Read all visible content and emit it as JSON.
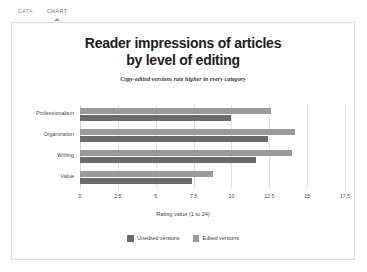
{
  "tabs": [
    {
      "label": "DATA",
      "active": false
    },
    {
      "label": "CHART",
      "active": true
    }
  ],
  "chart_data": {
    "type": "bar",
    "orientation": "horizontal",
    "title": "Reader impressions of articles by level of editing",
    "title_line1": "Reader impressions of articles",
    "title_line2": "by level of editing",
    "subtitle": "Copy-edited versions rate higher in every category",
    "categories": [
      "Professionalism",
      "Organization",
      "Writing",
      "Value"
    ],
    "series": [
      {
        "name": "Unedited versions",
        "color": "#6b6b6b",
        "values": [
          10.0,
          12.4,
          11.6,
          7.4
        ]
      },
      {
        "name": "Edited versions",
        "color": "#9a9a9a",
        "values": [
          12.6,
          14.2,
          14.0,
          8.8
        ]
      }
    ],
    "xlabel": "Rating value (1 to 24)",
    "ylabel": "",
    "xlim": [
      0,
      17.5
    ],
    "xticks": [
      0,
      2.5,
      5,
      7.5,
      10,
      12.5,
      15,
      17.5
    ],
    "xtick_labels": [
      "0",
      "2.5",
      "5",
      "7.5",
      "10",
      "12.5",
      "15",
      "17.5"
    ],
    "grid": true,
    "legend_position": "bottom"
  }
}
